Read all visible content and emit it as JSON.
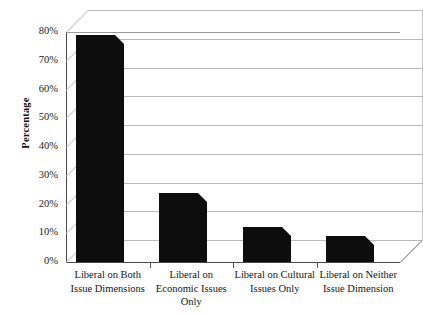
{
  "chart_data": {
    "type": "bar",
    "title": "",
    "xlabel": "",
    "ylabel": "Percentage",
    "categories": [
      "Liberal on Both Issue Dimensions",
      "Liberal on Economic Issues Only",
      "Liberal on Cultural Issues Only",
      "Liberal on Neither Issue Dimension"
    ],
    "values": [
      76,
      21,
      9,
      6
    ],
    "ylim": [
      0,
      80
    ],
    "yticks": [
      0,
      10,
      20,
      30,
      40,
      50,
      60,
      70,
      80
    ],
    "ytick_labels": [
      "0%",
      "10%",
      "20%",
      "30%",
      "40%",
      "50%",
      "60%",
      "70%",
      "80%"
    ],
    "grid": true,
    "legend": false,
    "style": "3d-column",
    "bar_color": "#0d0d0d",
    "grid_color": "#b9b9b9",
    "background": "#ffffff"
  },
  "axis": {
    "y_title": "Percentage"
  },
  "categories_wrapped": [
    [
      "Liberal on Both",
      "Issue Dimensions"
    ],
    [
      "Liberal on",
      "Economic Issues",
      "Only"
    ],
    [
      "Liberal on Cultural",
      "Issues Only"
    ],
    [
      "Liberal on Neither",
      "Issue Dimension"
    ]
  ]
}
